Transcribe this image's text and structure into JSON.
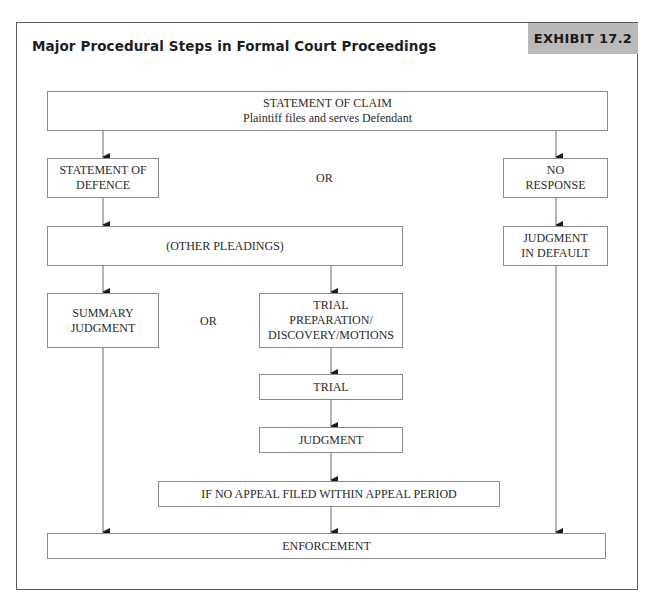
{
  "exhibit": {
    "title": "Major Procedural Steps in Formal Court Proceedings",
    "label": "EXHIBIT 17.2"
  },
  "flowchart": {
    "nodes": {
      "claim": {
        "line1": "STATEMENT OF CLAIM",
        "line2": "Plaintiff files and serves Defendant"
      },
      "defence": {
        "line1": "STATEMENT OF",
        "line2": "DEFENCE"
      },
      "no_response": {
        "line1": "NO",
        "line2": "RESPONSE"
      },
      "other_pleadings": {
        "line1": "(OTHER PLEADINGS)"
      },
      "default_judgment": {
        "line1": "JUDGMENT",
        "line2": "IN DEFAULT"
      },
      "summary_judgment": {
        "line1": "SUMMARY",
        "line2": "JUDGMENT"
      },
      "trial_prep": {
        "line1": "TRIAL",
        "line2": "PREPARATION/",
        "line3": "DISCOVERY/MOTIONS"
      },
      "trial": {
        "line1": "TRIAL"
      },
      "judgment": {
        "line1": "JUDGMENT"
      },
      "no_appeal": {
        "line1": "IF NO APPEAL FILED WITHIN APPEAL PERIOD"
      },
      "enforcement": {
        "line1": "ENFORCEMENT"
      }
    },
    "or_labels": {
      "top": "OR",
      "middle": "OR"
    },
    "edges": [
      [
        "claim",
        "defence"
      ],
      [
        "claim",
        "no_response"
      ],
      [
        "defence",
        "other_pleadings"
      ],
      [
        "no_response",
        "default_judgment"
      ],
      [
        "other_pleadings",
        "summary_judgment"
      ],
      [
        "other_pleadings",
        "trial_prep"
      ],
      [
        "trial_prep",
        "trial"
      ],
      [
        "trial",
        "judgment"
      ],
      [
        "judgment",
        "no_appeal"
      ],
      [
        "summary_judgment",
        "enforcement"
      ],
      [
        "no_appeal",
        "enforcement"
      ],
      [
        "default_judgment",
        "enforcement"
      ]
    ]
  }
}
